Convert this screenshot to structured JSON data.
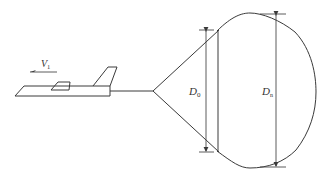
{
  "figure": {
    "labels": {
      "velocity": {
        "main": "V",
        "subscript": "1"
      },
      "nominal_diameter": {
        "main": "D",
        "subscript": "0"
      },
      "inflated_diameter": {
        "main": "D",
        "subscript": "n"
      }
    },
    "colors": {
      "line": "#3a3a3a",
      "background": "#ffffff"
    }
  }
}
